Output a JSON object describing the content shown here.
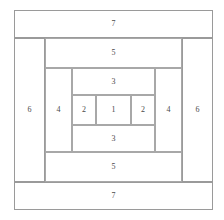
{
  "diagram": {
    "type": "log-cabin-quilt-block",
    "stroke_color": "#9a9a9a",
    "label_color": "#4a4a4a",
    "background_color": "#ffffff",
    "canvas": {
      "width": 224,
      "height": 220
    },
    "frame": {
      "x": 14,
      "y": 10,
      "width": 199,
      "height": 200
    },
    "pieces": [
      {
        "id": "strip-7-top",
        "label": "7",
        "orientation": "horizontal",
        "ring": 7,
        "position": "top",
        "x": 14,
        "y": 10,
        "width": 199,
        "height": 28
      },
      {
        "id": "strip-6-left",
        "label": "6",
        "orientation": "vertical",
        "ring": 6,
        "position": "left",
        "x": 14,
        "y": 38,
        "width": 31,
        "height": 144
      },
      {
        "id": "strip-6-right",
        "label": "6",
        "orientation": "vertical",
        "ring": 6,
        "position": "right",
        "x": 182,
        "y": 38,
        "width": 31,
        "height": 144
      },
      {
        "id": "strip-7-bottom",
        "label": "7",
        "orientation": "horizontal",
        "ring": 7,
        "position": "bottom",
        "x": 14,
        "y": 182,
        "width": 199,
        "height": 28
      },
      {
        "id": "strip-5-top",
        "label": "5",
        "orientation": "horizontal",
        "ring": 5,
        "position": "top",
        "x": 45,
        "y": 38,
        "width": 137,
        "height": 30
      },
      {
        "id": "strip-5-bottom",
        "label": "5",
        "orientation": "horizontal",
        "ring": 5,
        "position": "bottom",
        "x": 45,
        "y": 152,
        "width": 137,
        "height": 30
      },
      {
        "id": "strip-4-left",
        "label": "4",
        "orientation": "vertical",
        "ring": 4,
        "position": "left",
        "x": 45,
        "y": 68,
        "width": 27,
        "height": 84
      },
      {
        "id": "strip-4-right",
        "label": "4",
        "orientation": "vertical",
        "ring": 4,
        "position": "right",
        "x": 155,
        "y": 68,
        "width": 27,
        "height": 84
      },
      {
        "id": "strip-3-top",
        "label": "3",
        "orientation": "horizontal",
        "ring": 3,
        "position": "top",
        "x": 72,
        "y": 68,
        "width": 83,
        "height": 27
      },
      {
        "id": "strip-3-bottom",
        "label": "3",
        "orientation": "horizontal",
        "ring": 3,
        "position": "bottom",
        "x": 72,
        "y": 125,
        "width": 83,
        "height": 27
      },
      {
        "id": "strip-2-left",
        "label": "2",
        "orientation": "vertical",
        "ring": 2,
        "position": "left",
        "x": 72,
        "y": 95,
        "width": 24,
        "height": 30
      },
      {
        "id": "center-1",
        "label": "1",
        "orientation": "square",
        "ring": 1,
        "position": "center",
        "x": 96,
        "y": 95,
        "width": 35,
        "height": 30
      },
      {
        "id": "strip-2-right",
        "label": "2",
        "orientation": "vertical",
        "ring": 2,
        "position": "right",
        "x": 131,
        "y": 95,
        "width": 24,
        "height": 30
      }
    ]
  }
}
